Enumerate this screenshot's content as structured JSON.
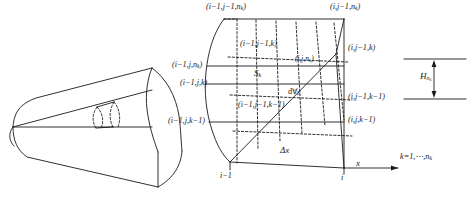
{
  "figure": {
    "type": "control-volume-grid-diagram",
    "line_color": "#1a1a1a",
    "background": "#ffffff"
  },
  "nozzle": {
    "name": "conical-nozzle-body",
    "note": "3D cone shown in perspective with two dashed transverse ring slices"
  },
  "cell": {
    "name": "hexahedral-control-volume",
    "vertices": {
      "top_front_left": "(i−1,j−1,n",
      "top_front_left_sub": "k",
      "top_front_left_end": ")"
    }
  },
  "labels": {
    "top_left": {
      "pre": "(i−1,j−1,n",
      "sub": "k",
      "post": ")"
    },
    "top_right": {
      "pre": "(i,j−1,n",
      "sub": "k",
      "post": ")"
    },
    "inner_top": {
      "pre": "(i−1,j−1,k)",
      "sub": "",
      "post": ""
    },
    "left_upper": {
      "pre": "(i−1,j,n",
      "sub": "k",
      "post": ")"
    },
    "left_mid": {
      "pre": "(i−1,j,k)",
      "sub": "",
      "post": ""
    },
    "left_lower": {
      "pre": "(i−1,j,k−1)",
      "sub": "",
      "post": ""
    },
    "inner_mid": {
      "pre": "(i,j,n",
      "sub": "k",
      "post": ")"
    },
    "right_upper": {
      "pre": "(i,j−1,k)",
      "sub": "",
      "post": ""
    },
    "right_lower": {
      "pre": "(i,j−1,k−1)",
      "sub": "",
      "post": ""
    },
    "right_bottom": {
      "pre": "(i,j,k−1)",
      "sub": "",
      "post": ""
    },
    "inner_bottom": {
      "pre": "(i−1,j−1,k−1)",
      "sub": "",
      "post": ""
    },
    "face_area": {
      "pre": "S",
      "sub": "k",
      "post": ""
    },
    "volume_element": {
      "pre": "d∀",
      "sub": "E",
      "post": ""
    },
    "delta_x": {
      "pre": "Δx",
      "sub": "",
      "post": ""
    },
    "axis_x": {
      "pre": "x",
      "sub": "",
      "post": ""
    },
    "tick_left": {
      "pre": "i−1",
      "sub": "",
      "post": ""
    },
    "tick_right": {
      "pre": "i",
      "sub": "",
      "post": ""
    },
    "height": {
      "pre": "H",
      "sub": "n",
      "sub2": "k",
      "post": ""
    },
    "k_range": {
      "pre": "k=1,⋯,n",
      "sub": "k",
      "post": ""
    }
  }
}
